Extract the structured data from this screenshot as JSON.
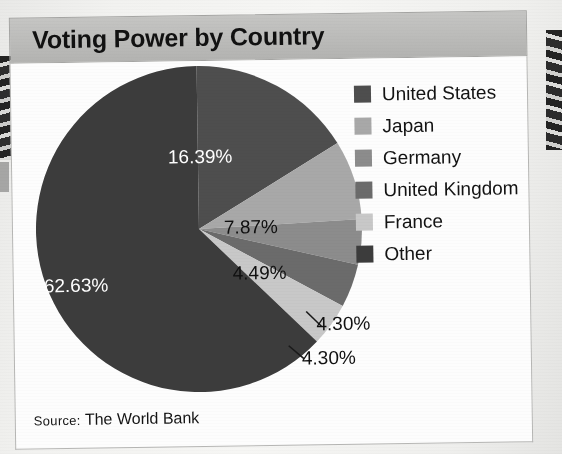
{
  "figure": {
    "title": "Voting Power by Country",
    "source_prefix": "Source:",
    "source_text": " The World Bank"
  },
  "legend": {
    "items": [
      {
        "label": "United States",
        "color": "#4e4e4e"
      },
      {
        "label": "Japan",
        "color": "#a8a8a8"
      },
      {
        "label": "Germany",
        "color": "#8c8c8c"
      },
      {
        "label": "United Kingdom",
        "color": "#6b6b6b"
      },
      {
        "label": "France",
        "color": "#c8c8c8"
      },
      {
        "label": "Other",
        "color": "#3c3c3c"
      }
    ]
  },
  "slice_labels": {
    "united_states": "16.39%",
    "japan": "7.87%",
    "germany": "4.49%",
    "united_kingdom": "4.30%",
    "france": "4.30%",
    "other": "62.63%"
  },
  "chart_data": {
    "type": "pie",
    "title": "Voting Power by Country",
    "subtitle": "",
    "xlabel": "",
    "ylabel": "",
    "unit": "percent",
    "source": "Source: The World Bank",
    "legend_position": "right",
    "grid": false,
    "start_angle_deg": 0,
    "direction": "clockwise",
    "categories": [
      "United States",
      "Japan",
      "Germany",
      "United Kingdom",
      "France",
      "Other"
    ],
    "values": [
      16.39,
      7.87,
      4.49,
      4.3,
      4.3,
      62.63
    ],
    "labels": [
      "16.39%",
      "7.87%",
      "4.49%",
      "4.30%",
      "4.30%",
      "62.63%"
    ],
    "colors": [
      "#4e4e4e",
      "#a8a8a8",
      "#8c8c8c",
      "#6b6b6b",
      "#c8c8c8",
      "#3c3c3c"
    ],
    "slices": [
      {
        "name": "United States",
        "value": 16.39,
        "label": "16.39%",
        "color": "#4e4e4e"
      },
      {
        "name": "Japan",
        "value": 7.87,
        "label": "7.87%",
        "color": "#a8a8a8"
      },
      {
        "name": "Germany",
        "value": 4.49,
        "label": "4.49%",
        "color": "#8c8c8c"
      },
      {
        "name": "United Kingdom",
        "value": 4.3,
        "label": "4.30%",
        "color": "#6b6b6b"
      },
      {
        "name": "France",
        "value": 4.3,
        "label": "4.30%",
        "color": "#c8c8c8"
      },
      {
        "name": "Other",
        "value": 62.63,
        "label": "62.63%",
        "color": "#3c3c3c"
      }
    ]
  }
}
